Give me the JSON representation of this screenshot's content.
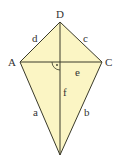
{
  "diagram": {
    "type": "kite",
    "fill_color": "#fbf5c4",
    "stroke_color": "#3a3a2a",
    "vertices": {
      "D": {
        "label": "D",
        "x": 60,
        "y": 22
      },
      "A": {
        "label": "A",
        "x": 20,
        "y": 62
      },
      "C": {
        "label": "C",
        "x": 102,
        "y": 62
      },
      "bottom": {
        "label": "",
        "x": 60,
        "y": 155
      }
    },
    "sides": {
      "d": {
        "label": "d"
      },
      "c": {
        "label": "c"
      },
      "a": {
        "label": "a"
      },
      "b": {
        "label": "b"
      }
    },
    "diagonals": {
      "e": {
        "label": "e"
      },
      "f": {
        "label": "f"
      }
    },
    "right_angle_marker": "·"
  }
}
